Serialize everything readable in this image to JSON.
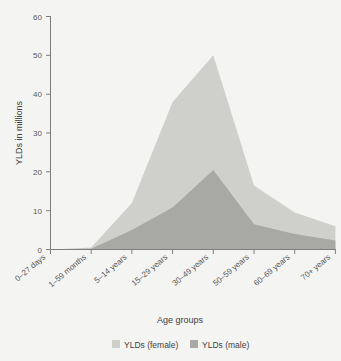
{
  "chart_data": {
    "type": "area",
    "title": "",
    "subtitle": "",
    "xlabel": "Age groups",
    "ylabel": "YLDs in millions",
    "categories": [
      "0–27 days",
      "1–59 months",
      "5–14 years",
      "15–29 years",
      "30–49 years",
      "50–59 years",
      "60–69 years",
      "70+ years"
    ],
    "series": [
      {
        "name": "YLDs (female)",
        "color": "#cfcfcb",
        "values": [
          0,
          0.3,
          7.0,
          27.2,
          29.5,
          10.0,
          5.5,
          3.7
        ]
      },
      {
        "name": "YLDs (male)",
        "color": "#a8a8a4",
        "values": [
          0,
          0.2,
          5.0,
          10.8,
          20.5,
          6.5,
          4.0,
          2.3
        ]
      }
    ],
    "stacked_totals": [
      0,
      0.5,
      12.0,
      38.0,
      50.0,
      16.5,
      9.5,
      6.0
    ],
    "ylim": [
      0,
      60
    ],
    "yticks": [
      0,
      10,
      20,
      30,
      40,
      50,
      60
    ],
    "ytick_labels": [
      "0",
      "10",
      "20",
      "30",
      "40",
      "50",
      "60"
    ],
    "grid": false,
    "legend_position": "bottom",
    "stacked": true
  },
  "legend": {
    "entries": [
      {
        "label": "YLDs (female)",
        "color": "#cfcfcb"
      },
      {
        "label": "YLDs (male)",
        "color": "#a8a8a4"
      }
    ]
  },
  "axes": {
    "y_title": "YLDs in millions",
    "x_title": "Age groups",
    "y_tick_0": "0",
    "y_tick_1": "10",
    "y_tick_2": "20",
    "y_tick_3": "30",
    "y_tick_4": "40",
    "y_tick_5": "50",
    "y_tick_6": "60",
    "x_tick_0": "0–27 days",
    "x_tick_1": "1–59 months",
    "x_tick_2": "5–14 years",
    "x_tick_3": "15–29 years",
    "x_tick_4": "30–49 years",
    "x_tick_5": "50–59 years",
    "x_tick_6": "60–69 years",
    "x_tick_7": "70+ years"
  },
  "colors": {
    "background": "#f4f4f2",
    "female": "#cfcfcb",
    "male": "#a8a8a4",
    "axis": "#7e7e7e",
    "text": "#58585a"
  }
}
